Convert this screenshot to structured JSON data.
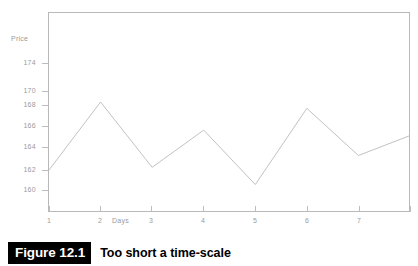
{
  "caption": {
    "number": "Figure 12.1",
    "text": "Too short a time-scale"
  },
  "chart_data": {
    "type": "line",
    "title": "",
    "xlabel": "Days",
    "ylabel": "Price",
    "x": [
      1,
      2,
      3,
      4,
      5,
      6,
      7,
      8
    ],
    "values": [
      162.2,
      169.7,
      162.5,
      166.6,
      160.6,
      169.0,
      163.8,
      166.0
    ],
    "series": [
      {
        "name": "Price",
        "values": [
          162.2,
          169.7,
          162.5,
          166.6,
          160.6,
          169.0,
          163.8,
          166.0
        ]
      }
    ],
    "x_tick_labels": [
      "1",
      "2",
      "3",
      "4",
      "5",
      "6",
      "7"
    ],
    "y_tick_labels": [
      "174",
      "170",
      "168",
      "166",
      "164",
      "162",
      "160"
    ],
    "y_tick_values": [
      174,
      170,
      168,
      166,
      164,
      162,
      160
    ],
    "xlim": [
      1,
      8
    ],
    "ylim": [
      156.8,
      177.5
    ],
    "grid": false,
    "legend": "none",
    "line_color": "#c2c2c4",
    "frame_color": "#b9b9bb",
    "label_color": "#9b9b9d"
  }
}
